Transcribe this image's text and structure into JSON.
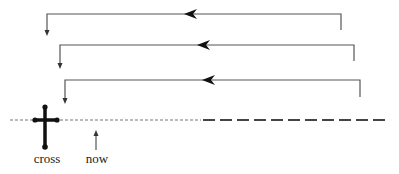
{
  "diagram": {
    "labels": {
      "cross": "cross",
      "now": "now"
    },
    "colors": {
      "line": "#555555",
      "timeline_past": "#777777",
      "timeline_future": "#444444",
      "cross": "#111111",
      "text": "#222222"
    },
    "loops": [
      {
        "y": 14,
        "x_left": 47,
        "x_right": 341,
        "right_drop_to": 30,
        "left_drop_to": 35,
        "arrow_x": 192
      },
      {
        "y": 45,
        "x_left": 60,
        "x_right": 354,
        "right_drop_to": 61,
        "left_drop_to": 68,
        "arrow_x": 205
      },
      {
        "y": 80,
        "x_left": 65,
        "x_right": 360,
        "right_drop_to": 97,
        "left_drop_to": 103,
        "arrow_x": 210
      }
    ],
    "timeline": {
      "y": 120,
      "past_start_x": 10,
      "split_x": 201,
      "future_end_x": 390
    },
    "cross_marker": {
      "x": 45,
      "top_y": 107,
      "bottom_y": 147,
      "bar_left_x": 35,
      "bar_right_x": 57
    },
    "now_marker": {
      "x": 96,
      "tail_y": 150,
      "head_y": 130
    }
  }
}
